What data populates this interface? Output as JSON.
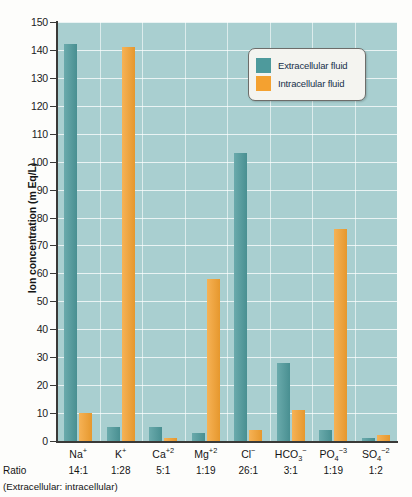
{
  "chart_data": {
    "type": "bar",
    "title": "",
    "xlabel": "",
    "ylabel": "Ion concentration (m Eq/L)",
    "ylim": [
      0,
      150
    ],
    "ytick_step": 10,
    "yticks": [
      0,
      10,
      20,
      30,
      40,
      50,
      60,
      70,
      80,
      90,
      100,
      110,
      120,
      130,
      140,
      150
    ],
    "grid": true,
    "legend_position": "upper-right-inside",
    "categories": [
      "Na+",
      "K+",
      "Ca+2",
      "Mg+2",
      "Cl-",
      "HCO3-",
      "PO4-3",
      "SO4-2"
    ],
    "series": [
      {
        "name": "Extracellular fluid",
        "color": "#4e9a9c",
        "values": [
          142,
          5,
          5,
          3,
          103,
          28,
          4,
          1
        ]
      },
      {
        "name": "Intracellular fluid",
        "color": "#f4a130",
        "values": [
          10,
          141,
          1,
          58,
          4,
          11,
          76,
          2
        ]
      }
    ],
    "ratios": [
      "14:1",
      "1:28",
      "5:1",
      "1:19",
      "26:1",
      "3:1",
      "1:19",
      "1:2"
    ],
    "ratio_label": "Ratio",
    "ratio_caption": "(Extracellular: intracellular)",
    "plot_background": "#a9cfd0",
    "gridline_color": "#ffffff"
  },
  "axis": {
    "y_title": "Ion concentration (m Eq/L)",
    "tick_labels": [
      "150",
      "140",
      "130",
      "120",
      "110",
      "100",
      "90",
      "80",
      "70",
      "60",
      "50",
      "40",
      "30",
      "20",
      "10",
      "0"
    ]
  },
  "legend": {
    "items": [
      {
        "label": "Extracellular fluid",
        "color": "#4e9a9c"
      },
      {
        "label": "Intracellular fluid",
        "color": "#f4a130"
      }
    ]
  },
  "xaxis": {
    "ions": [
      {
        "base": "Na",
        "sup": "+",
        "sub": ""
      },
      {
        "base": "K",
        "sup": "+",
        "sub": ""
      },
      {
        "base": "Ca",
        "sup": "+2",
        "sub": ""
      },
      {
        "base": "Mg",
        "sup": "+2",
        "sub": ""
      },
      {
        "base": "Cl",
        "sup": "−",
        "sub": ""
      },
      {
        "base": "HCO",
        "sup": "−",
        "sub": "3"
      },
      {
        "base": "PO",
        "sup": "−3",
        "sub": "4"
      },
      {
        "base": "SO",
        "sup": "−2",
        "sub": "4"
      }
    ]
  }
}
